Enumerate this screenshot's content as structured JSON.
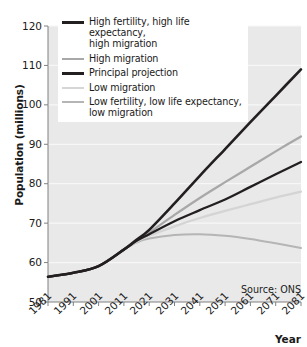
{
  "chart_data": {
    "type": "line",
    "title": "",
    "xlabel": "Year",
    "ylabel": "Population (millions)",
    "xlim": [
      1981,
      2081
    ],
    "ylim": [
      50,
      120
    ],
    "ytick_labels": [
      "120",
      "110",
      "100",
      "90",
      "80",
      "70",
      "60",
      "50"
    ],
    "ytick_values": [
      120,
      110,
      100,
      90,
      80,
      70,
      60,
      50
    ],
    "xtick_labels": [
      "1981",
      "1991",
      "2001",
      "2011",
      "2021",
      "2031",
      "2041",
      "2051",
      "2061",
      "2071",
      "2081"
    ],
    "xtick_values": [
      1981,
      1991,
      2001,
      2011,
      2021,
      2031,
      2041,
      2051,
      2061,
      2071,
      2081
    ],
    "grid": "horizontal",
    "legend_position": "top-left-inside",
    "annotation": "Source: ONS",
    "x": [
      1981,
      1991,
      2001,
      2011,
      2016,
      2021,
      2031,
      2041,
      2051,
      2061,
      2071,
      2081
    ],
    "series": [
      {
        "name": "High fertility, high life expectancy, high migration",
        "color": "#231f20",
        "width": 2.6,
        "values": [
          56.4,
          57.4,
          59.1,
          63.3,
          65.8,
          68.3,
          75.0,
          82.0,
          88.8,
          95.6,
          102.3,
          109.0
        ]
      },
      {
        "name": "High migration",
        "color": "#a8a8a8",
        "width": 2.3,
        "values": [
          56.4,
          57.4,
          59.1,
          63.3,
          65.6,
          67.6,
          72.1,
          76.4,
          80.4,
          84.3,
          88.2,
          92.0
        ]
      },
      {
        "name": "Principal projection",
        "color": "#231f20",
        "width": 2.3,
        "values": [
          56.4,
          57.4,
          59.1,
          63.3,
          65.5,
          67.2,
          70.5,
          73.3,
          76.0,
          79.2,
          82.4,
          85.5
        ]
      },
      {
        "name": "Low migration",
        "color": "#d4d4d4",
        "width": 2.3,
        "values": [
          56.4,
          57.4,
          59.1,
          63.3,
          65.3,
          66.8,
          69.2,
          71.3,
          73.1,
          74.8,
          76.5,
          78.0
        ]
      },
      {
        "name": "Low fertility, low life expectancy, low migration",
        "color": "#b5b5b5",
        "width": 2.0,
        "values": [
          56.4,
          57.4,
          59.1,
          63.3,
          65.1,
          66.1,
          67.0,
          67.2,
          66.8,
          66.0,
          64.9,
          63.7
        ]
      }
    ]
  },
  "axes": {
    "y_title": "Population (millions)",
    "x_title": "Year"
  },
  "legend": {
    "items": [
      {
        "label_line1": "High fertility, high life expectancy,",
        "label_line2": "high migration",
        "color": "#231f20",
        "thickness": "3.2px"
      },
      {
        "label_line1": "High migration",
        "label_line2": "",
        "color": "#a8a8a8",
        "thickness": "2.6px"
      },
      {
        "label_line1": "Principal projection",
        "label_line2": "",
        "color": "#231f20",
        "thickness": "2.8px"
      },
      {
        "label_line1": "Low migration",
        "label_line2": "",
        "color": "#d6d6d6",
        "thickness": "2.6px"
      },
      {
        "label_line1": "Low fertility, low life expectancy,",
        "label_line2": "low migration",
        "color": "#b5b5b5",
        "thickness": "2.4px"
      }
    ]
  },
  "source": {
    "text": "Source: ONS"
  },
  "colors": {
    "plot_background": "#e9e9e9",
    "gridline": "#f7f7f7",
    "axis": "#808080",
    "text": "#1a1a1a"
  }
}
